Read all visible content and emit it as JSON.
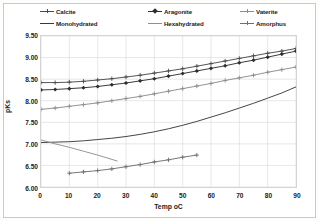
{
  "chart_data": {
    "type": "line",
    "title": "",
    "xlabel": "Temp oC",
    "ylabel": "pKs",
    "xlim": [
      0,
      90
    ],
    "ylim": [
      6.0,
      9.5
    ],
    "xticks": [
      "0",
      "10",
      "20",
      "30",
      "40",
      "50",
      "60",
      "70",
      "80",
      "90"
    ],
    "yticks": [
      "6.00",
      "6.50",
      "7.00",
      "7.50",
      "8.00",
      "8.50",
      "9.00",
      "9.50"
    ],
    "grid": true,
    "legend_position": "top",
    "series": [
      {
        "name": "Calcite",
        "color": "#4a4a4a",
        "marker": "plus",
        "x": [
          0,
          5,
          10,
          15,
          20,
          25,
          30,
          35,
          40,
          45,
          50,
          55,
          60,
          65,
          70,
          75,
          80,
          85,
          90
        ],
        "y": [
          8.42,
          8.42,
          8.43,
          8.45,
          8.48,
          8.51,
          8.55,
          8.59,
          8.64,
          8.69,
          8.74,
          8.8,
          8.86,
          8.92,
          8.98,
          9.04,
          9.1,
          9.15,
          9.21
        ]
      },
      {
        "name": "Aragonite",
        "color": "#2e2e2e",
        "marker": "diamond",
        "x": [
          0,
          5,
          10,
          15,
          20,
          25,
          30,
          35,
          40,
          45,
          50,
          55,
          60,
          65,
          70,
          75,
          80,
          85,
          90
        ],
        "y": [
          8.25,
          8.26,
          8.28,
          8.3,
          8.33,
          8.37,
          8.41,
          8.46,
          8.51,
          8.57,
          8.63,
          8.69,
          8.75,
          8.81,
          8.88,
          8.94,
          9.01,
          9.08,
          9.15
        ]
      },
      {
        "name": "Vaterite",
        "color": "#8c8c8c",
        "marker": "plus",
        "x": [
          0,
          5,
          10,
          15,
          20,
          25,
          30,
          35,
          40,
          45,
          50,
          55,
          60,
          65,
          70,
          75,
          80,
          85,
          90
        ],
        "y": [
          7.8,
          7.83,
          7.87,
          7.91,
          7.95,
          8.0,
          8.05,
          8.1,
          8.16,
          8.22,
          8.28,
          8.34,
          8.4,
          8.47,
          8.53,
          8.59,
          8.66,
          8.72,
          8.78
        ]
      },
      {
        "name": "Monohydrated",
        "color": "#3a3a3a",
        "marker": "none",
        "x": [
          0,
          5,
          10,
          15,
          20,
          25,
          30,
          35,
          40,
          45,
          50,
          55,
          60,
          65,
          70,
          75,
          80,
          85,
          90
        ],
        "y": [
          7.03,
          7.04,
          7.05,
          7.07,
          7.1,
          7.13,
          7.17,
          7.22,
          7.28,
          7.35,
          7.43,
          7.52,
          7.62,
          7.72,
          7.83,
          7.94,
          8.06,
          8.18,
          8.32
        ]
      },
      {
        "name": "Hexahydrated",
        "color": "#8f8f8f",
        "marker": "none",
        "x": [
          0,
          5,
          10,
          15,
          20,
          27
        ],
        "y": [
          7.09,
          7.0,
          6.92,
          6.83,
          6.74,
          6.6
        ]
      },
      {
        "name": "Amorphus",
        "color": "#6f6f6f",
        "marker": "plus",
        "x": [
          10,
          15,
          20,
          25,
          30,
          35,
          40,
          45,
          50,
          55
        ],
        "y": [
          6.32,
          6.35,
          6.38,
          6.42,
          6.47,
          6.52,
          6.58,
          6.63,
          6.69,
          6.74
        ]
      }
    ]
  }
}
